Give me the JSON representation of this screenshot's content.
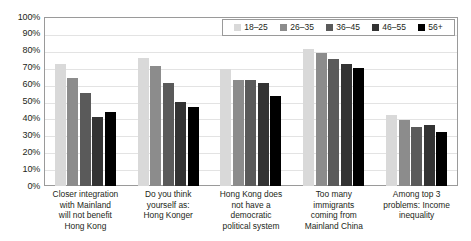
{
  "chart_data": {
    "type": "bar",
    "title": "",
    "xlabel": "",
    "ylabel": "",
    "ylim": [
      0,
      100
    ],
    "grid": true,
    "legend_position": "top-right",
    "categories": [
      "Closer integration with Mainland will not benefit Hong Kong",
      "Do you think yourself as: Hong Konger",
      "Hong Kong does not have a democratic political system",
      "Too many immigrants coming from Mainland China",
      "Among top 3 problems: Income inequality"
    ],
    "category_lines": [
      [
        "Closer integration",
        "with Mainland",
        "will not benefit",
        "Hong Kong"
      ],
      [
        "Do you think",
        "yourself as:",
        "Hong Konger"
      ],
      [
        "Hong Kong does",
        "not have a",
        "democratic",
        "political system"
      ],
      [
        "Too many",
        "immigrants",
        "coming from",
        "Mainland China"
      ],
      [
        "Among top 3",
        "problems: Income",
        "inequality"
      ]
    ],
    "ytick_labels": [
      "100%",
      "90%",
      "80%",
      "70%",
      "60%",
      "50%",
      "40%",
      "30%",
      "20%",
      "10%",
      "0%"
    ],
    "ytick_values": [
      100,
      90,
      80,
      70,
      60,
      50,
      40,
      30,
      20,
      10,
      0
    ],
    "series": [
      {
        "name": "18–25",
        "color": "#d9d9d9",
        "values": [
          72,
          76,
          69,
          81,
          42
        ]
      },
      {
        "name": "26–35",
        "color": "#8c8c8c",
        "values": [
          64,
          71,
          63,
          79,
          39
        ]
      },
      {
        "name": "36–45",
        "color": "#5a5a5a",
        "values": [
          55,
          61,
          63,
          75,
          35
        ]
      },
      {
        "name": "46–55",
        "color": "#333333",
        "values": [
          41,
          50,
          61,
          72,
          36
        ]
      },
      {
        "name": "56+",
        "color": "#000000",
        "values": [
          44,
          47,
          53,
          70,
          32
        ]
      }
    ]
  }
}
